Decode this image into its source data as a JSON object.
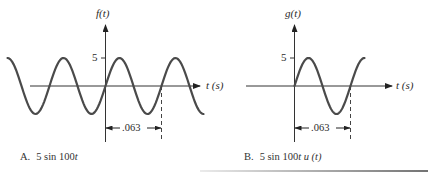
{
  "chart_data": [
    {
      "type": "line",
      "panel": "A",
      "title": "5 sin 100t",
      "caption_letter": "A.",
      "caption_text": "5 sin 100",
      "caption_var": "t",
      "ylabel": "f(t)",
      "xlabel": "t (s)",
      "y_tick_labels": [
        "5"
      ],
      "y_ticks": [
        5
      ],
      "amplitude": 5,
      "angular_frequency": 100,
      "period_annotation": ".063",
      "period_seconds": 0.063,
      "x_range_periods": [
        -1.75,
        1.75
      ],
      "function": "5*sin(100*t)",
      "grid": false
    },
    {
      "type": "line",
      "panel": "B",
      "title": "5 sin 100t u(t)",
      "caption_letter": "B.",
      "caption_text": "5 sin 100",
      "caption_var": "t u (t)",
      "ylabel": "g(t)",
      "xlabel": "t (s)",
      "y_tick_labels": [
        "5"
      ],
      "y_ticks": [
        5
      ],
      "amplitude": 5,
      "angular_frequency": 100,
      "period_annotation": ".063",
      "period_seconds": 0.063,
      "x_range_periods": [
        0,
        1.25
      ],
      "function": "5*sin(100*t)*u(t)",
      "grid": false
    }
  ],
  "colors": {
    "curve": "#4a4a4a",
    "axis": "#333333",
    "text": "#2b2b2b"
  }
}
